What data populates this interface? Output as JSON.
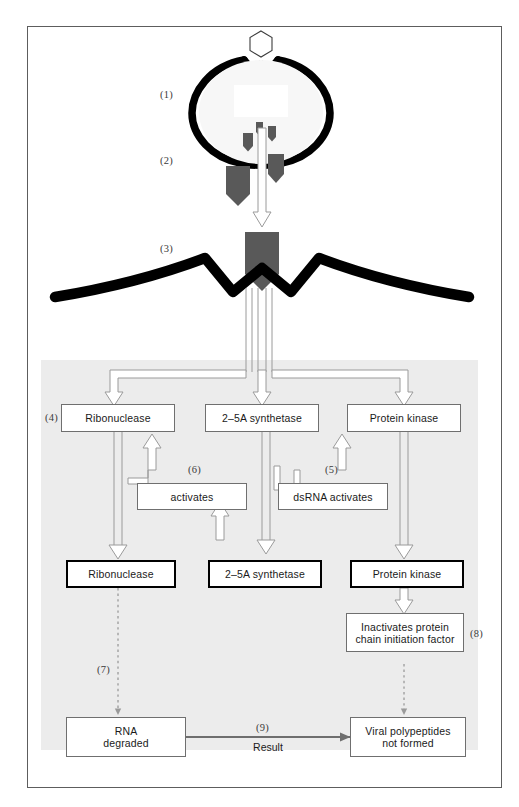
{
  "figure": {
    "type": "interferon-antiviral-pathway-diagram",
    "background_color": "#ffffff",
    "panel_color": "#ececec",
    "border_color": "#5d5d5d",
    "virus_color": "#595959",
    "membrane_color": "#000000",
    "arrow_outline_color": "#8c8c8c",
    "result_arrow_color": "#6e6e6e"
  },
  "step_labels": {
    "s1": "(1)",
    "s2": "(2)",
    "s3": "(3)",
    "s4": "(4)",
    "s5": "(5)",
    "s6": "(6)",
    "s7": "(7)",
    "s8": "(8)",
    "s9": "(9)"
  },
  "enzyme_row": {
    "ribonuclease": "Ribonuclease",
    "synthetase": "2–5A synthetase",
    "kinase": "Protein kinase"
  },
  "activator_row": {
    "activates": "activates",
    "dsrna_activates": "dsRNA activates"
  },
  "active_row": {
    "ribonuclease": "Ribonuclease",
    "synthetase": "2–5A synthetase",
    "kinase": "Protein kinase"
  },
  "effect_box": {
    "line1": "Inactivates protein",
    "line2": "chain initiation factor"
  },
  "outcome_row": {
    "rna_line1": "RNA",
    "rna_line2": "degraded",
    "viral_line1": "Viral polypeptides",
    "viral_line2": "not formed"
  },
  "result_connector": {
    "label": "Result"
  }
}
